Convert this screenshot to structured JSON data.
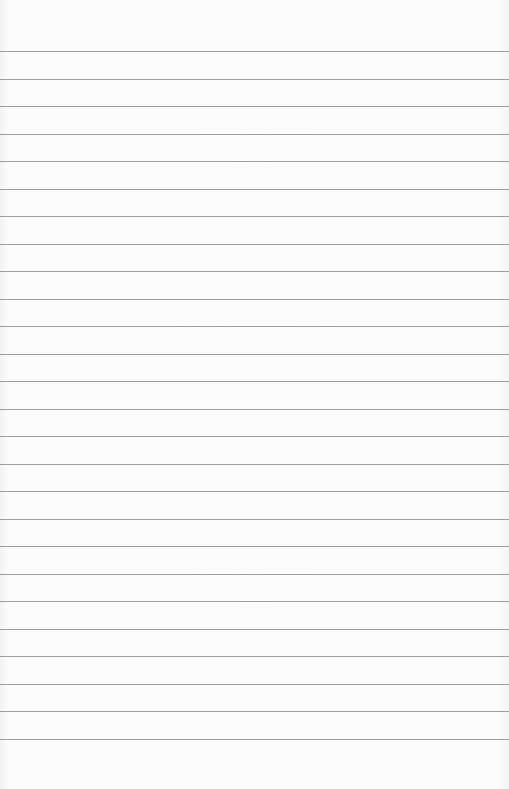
{
  "page": {
    "type": "lined-paper",
    "background_color": "#fbfbfa",
    "rule_color": "#8c8c8c",
    "rule_count": 26,
    "first_rule_y": 51,
    "rule_spacing": 27.5
  }
}
